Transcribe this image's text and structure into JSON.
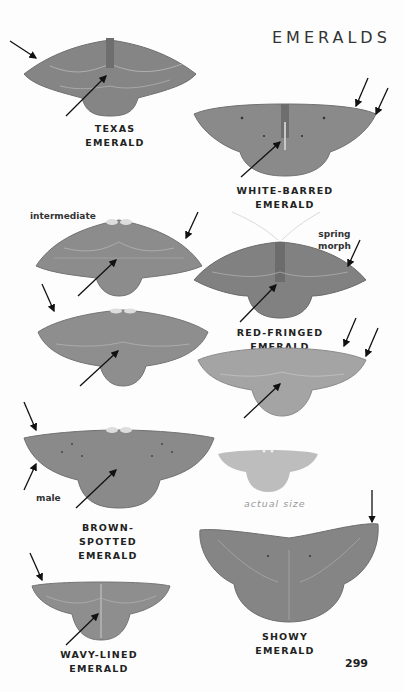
{
  "page": {
    "title": "EMERALDS",
    "page_number": "299",
    "colors": {
      "moth_dark": "#7a7a7a",
      "moth_mid": "#8c8c8c",
      "moth_light": "#a8a8a8",
      "actual_size": "#bdbdbd",
      "text": "#222222",
      "muted": "#999999"
    }
  },
  "species": [
    {
      "name": "TEXAS EMERALD"
    },
    {
      "name": "WHITE-BARRED EMERALD"
    },
    {
      "name": "RED-FRINGED EMERALD",
      "notes": [
        "intermediate",
        "spring\nmorph"
      ]
    },
    {
      "name": "BROWN-SPOTTED\nEMERALD",
      "notes": [
        "male"
      ]
    },
    {
      "name": "WAVY-LINED\nEMERALD"
    },
    {
      "name": "SHOWY EMERALD"
    }
  ],
  "labels": {
    "intermediate": "intermediate",
    "spring": "spring",
    "morph": "morph",
    "male": "male",
    "actual_size": "actual size",
    "brown_spotted_1": "BROWN-SPOTTED",
    "brown_spotted_2": "EMERALD",
    "wavy_lined_1": "WAVY-LINED",
    "wavy_lined_2": "EMERALD"
  }
}
